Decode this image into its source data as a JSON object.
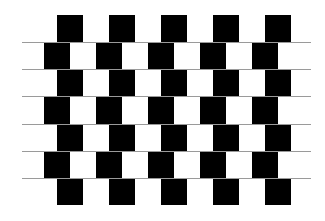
{
  "figure": {
    "name": "cafe-wall-illusion",
    "background": "#ffffff",
    "tile_color": "#000000",
    "mortar_color": "#9a9a9a",
    "rows": 7,
    "tiles_per_row": 5,
    "row_height": 27,
    "tile_width": 26,
    "period": 52,
    "top": 15,
    "odd_row_offset_x": 57,
    "even_row_offset_x": 44,
    "mortar_lines": {
      "x_start": 22,
      "x_end": 311,
      "y_positions": [
        42,
        69,
        96,
        124,
        151,
        178
      ]
    }
  }
}
